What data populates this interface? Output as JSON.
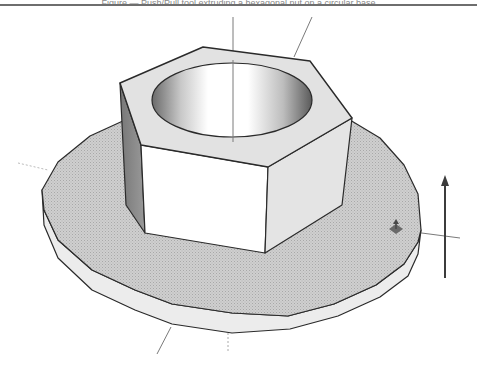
{
  "header": {
    "caption": "Figure — Push/Pull tool extruding a hexagonal nut on a circular base"
  },
  "viewport": {
    "background": "#ffffff",
    "colors": {
      "edge": "#2a2a2a",
      "face_top": "#e2e2e2",
      "face_front": "#ffffff",
      "face_right": "#e4e4e4",
      "face_left": "#8a8a8a",
      "disc_top": "#c9c9c9",
      "disc_side": "#ececec",
      "axis_line": "#7a7a7a",
      "arrow": "#3c3c3c"
    },
    "model": {
      "base_disc": "circular-plate",
      "nut": "hexagonal-nut-with-bore"
    },
    "cursor": "push-pull-cursor-icon",
    "direction_indicator": "up-arrow-icon"
  }
}
